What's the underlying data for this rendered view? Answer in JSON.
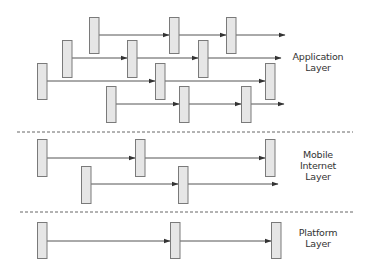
{
  "colors": {
    "box_fill": "#e6e6e6",
    "box_stroke": "#7a7a7a",
    "arrow": "#555555",
    "divider": "#666666",
    "text": "#333333"
  },
  "layers": [
    {
      "id": "application",
      "label_lines": [
        "Application",
        "Layer"
      ],
      "label_pos": {
        "x": 318,
        "y": 56
      },
      "rows": [
        {
          "y": 35,
          "box_top": 17,
          "box_bottom": 53,
          "boxes": [
            89,
            169,
            226
          ],
          "arrow_end": 285
        },
        {
          "y": 58,
          "box_top": 40,
          "box_bottom": 77,
          "boxes": [
            62,
            127,
            198
          ],
          "arrow_end": 281
        },
        {
          "y": 81,
          "box_top": 63,
          "box_bottom": 99,
          "boxes": [
            37,
            155,
            265
          ],
          "arrow_end": 265
        },
        {
          "y": 104,
          "box_top": 86,
          "box_bottom": 122,
          "boxes": [
            106,
            179,
            241
          ],
          "arrow_end": 284
        }
      ]
    },
    {
      "id": "mobile-internet",
      "label_lines": [
        "Mobile",
        "Internet",
        "Layer"
      ],
      "label_pos": {
        "x": 318,
        "y": 154
      },
      "rows": [
        {
          "y": 158,
          "box_top": 139,
          "box_bottom": 176,
          "boxes": [
            37,
            135,
            265
          ],
          "arrow_end": 265
        },
        {
          "y": 184,
          "box_top": 166,
          "box_bottom": 203,
          "boxes": [
            81,
            178
          ],
          "arrow_end": 278
        }
      ]
    },
    {
      "id": "platform",
      "label_lines": [
        "Platform",
        "Layer"
      ],
      "label_pos": {
        "x": 318,
        "y": 227
      },
      "rows": [
        {
          "y": 241,
          "box_top": 222,
          "box_bottom": 258,
          "boxes": [
            37,
            170,
            271
          ],
          "arrow_end": 271
        }
      ]
    }
  ],
  "dividers": [
    {
      "y": 132,
      "x1": 17,
      "x2": 353
    },
    {
      "y": 212,
      "x1": 20,
      "x2": 353
    }
  ],
  "box_width": 9.5
}
